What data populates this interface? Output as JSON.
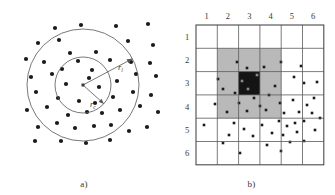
{
  "figure": {
    "panels": [
      {
        "id": "a",
        "caption": "a)",
        "type": "concentric-circles-scatter",
        "center": [
          83,
          85
        ],
        "radii": {
          "inner": {
            "label": "r",
            "subscript": "c",
            "value": 28
          },
          "outer": {
            "label": "r",
            "subscript": "l",
            "value": 56
          }
        },
        "label_inner_pos": [
          90,
          107
        ],
        "label_outer_pos": [
          118,
          70
        ],
        "points": [
          [
            55,
            28
          ],
          [
            81,
            25
          ],
          [
            116,
            26
          ],
          [
            148,
            24
          ],
          [
            38,
            43
          ],
          [
            59,
            40
          ],
          [
            70,
            53
          ],
          [
            96,
            52
          ],
          [
            128,
            41
          ],
          [
            153,
            45
          ],
          [
            26,
            59
          ],
          [
            44,
            62
          ],
          [
            62,
            69
          ],
          [
            78,
            61
          ],
          [
            92,
            70
          ],
          [
            110,
            60
          ],
          [
            131,
            62
          ],
          [
            150,
            63
          ],
          [
            31,
            77
          ],
          [
            52,
            74
          ],
          [
            66,
            84
          ],
          [
            89,
            78
          ],
          [
            99,
            87
          ],
          [
            117,
            81
          ],
          [
            136,
            74
          ],
          [
            156,
            76
          ],
          [
            36,
            92
          ],
          [
            58,
            98
          ],
          [
            79,
            101
          ],
          [
            95,
            103
          ],
          [
            113,
            97
          ],
          [
            133,
            92
          ],
          [
            151,
            95
          ],
          [
            27,
            110
          ],
          [
            47,
            107
          ],
          [
            68,
            115
          ],
          [
            87,
            112
          ],
          [
            102,
            113
          ],
          [
            120,
            110
          ],
          [
            140,
            106
          ],
          [
            158,
            112
          ],
          [
            38,
            127
          ],
          [
            57,
            123
          ],
          [
            75,
            128
          ],
          [
            94,
            126
          ],
          [
            111,
            125
          ],
          [
            129,
            131
          ],
          [
            147,
            127
          ],
          [
            61,
            141
          ],
          [
            86,
            143
          ],
          [
            110,
            140
          ],
          [
            35,
            141
          ]
        ]
      },
      {
        "id": "b",
        "caption": "b)",
        "type": "grid-cells-scatter",
        "grid": {
          "cols": 6,
          "rows": 6,
          "col_labels": [
            "1",
            "2",
            "3",
            "4",
            "5",
            "6"
          ],
          "row_labels": [
            "1",
            "2",
            "3",
            "4",
            "5",
            "6"
          ],
          "x0": 28,
          "y0": 25,
          "cell_w": 21.3,
          "cell_h": 23.3
        },
        "highlight": {
          "gray_region": {
            "col_start": 2,
            "col_end": 4,
            "row_start": 2,
            "row_end": 4,
            "color": "#b9b9b9"
          },
          "dark_cell": {
            "col": 3,
            "row": 3,
            "color": "#141414"
          }
        },
        "points": [
          [
            51,
            43
          ],
          [
            41,
            37
          ],
          [
            68,
            42
          ],
          [
            85,
            37
          ],
          [
            105,
            41
          ],
          [
            22,
            54
          ],
          [
            46,
            56
          ],
          [
            61,
            50
          ],
          [
            79,
            61
          ],
          [
            98,
            52
          ],
          [
            108,
            58
          ],
          [
            121,
            57
          ],
          [
            27,
            64
          ],
          [
            39,
            68
          ],
          [
            52,
            64
          ],
          [
            73,
            70
          ],
          [
            19,
            79
          ],
          [
            43,
            78
          ],
          [
            58,
            73
          ],
          [
            64,
            81
          ],
          [
            84,
            78
          ],
          [
            97,
            75
          ],
          [
            111,
            80
          ],
          [
            118,
            73
          ],
          [
            31,
            87
          ],
          [
            51,
            86
          ],
          [
            70,
            85
          ],
          [
            88,
            88
          ],
          [
            103,
            87
          ],
          [
            116,
            88
          ],
          [
            8,
            100
          ],
          [
            38,
            98
          ],
          [
            48,
            104
          ],
          [
            66,
            100
          ],
          [
            83,
            96
          ],
          [
            91,
            101
          ],
          [
            99,
            98
          ],
          [
            108,
            96
          ],
          [
            124,
            93
          ],
          [
            33,
            110
          ],
          [
            57,
            111
          ],
          [
            76,
            108
          ],
          [
            87,
            110
          ],
          [
            101,
            107
          ],
          [
            119,
            105
          ],
          [
            27,
            118
          ],
          [
            71,
            120
          ],
          [
            94,
            117
          ],
          [
            108,
            116
          ],
          [
            44,
            128
          ],
          [
            85,
            126
          ]
        ]
      }
    ]
  }
}
